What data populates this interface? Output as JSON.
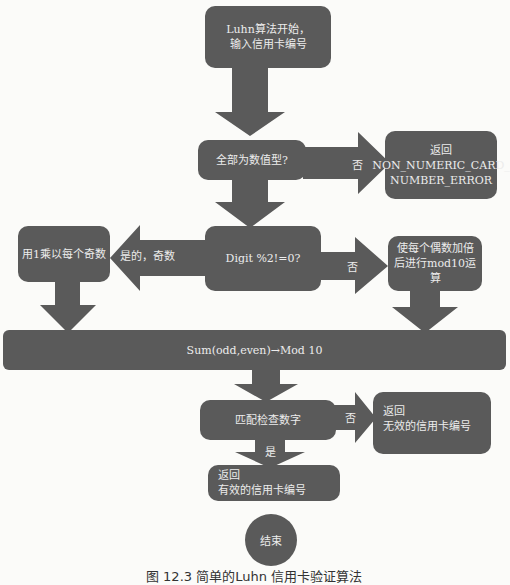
{
  "diagram": {
    "nodes": {
      "start": {
        "line1": "Luhn算法开始，",
        "line2": "输入信用卡编号"
      },
      "check_numeric": {
        "label": "全部为数值型?"
      },
      "numeric_error": {
        "line1": "返回",
        "line2": "NON_NUMERIC_CARD_",
        "line3": "NUMBER_ERROR"
      },
      "digit_check": {
        "label": "Digit %2!=0?"
      },
      "odd_multiply": {
        "label": "用1乘以每个奇数"
      },
      "even_double": {
        "line1": "使每个偶数加倍",
        "line2": "后进行mod10运算"
      },
      "sum_mod": {
        "label": "Sum(odd,even)→Mod 10"
      },
      "match_check": {
        "label": "匹配检查数字"
      },
      "invalid": {
        "line1": "返回",
        "line2": "无效的信用卡编号"
      },
      "valid": {
        "line1": "返回",
        "line2": "有效的信用卡编号"
      },
      "end": {
        "label": "结束"
      }
    },
    "edges": {
      "numeric_no": "否",
      "odd_yes": "是的，奇数",
      "even_no": "否",
      "match_no": "否",
      "match_yes": "是"
    },
    "colors": {
      "node_fill": "#5a5a5a",
      "text": "#ececec",
      "background": "#fbfbf9"
    }
  },
  "caption": "图 12.3   简单的Luhn 信用卡验证算法"
}
